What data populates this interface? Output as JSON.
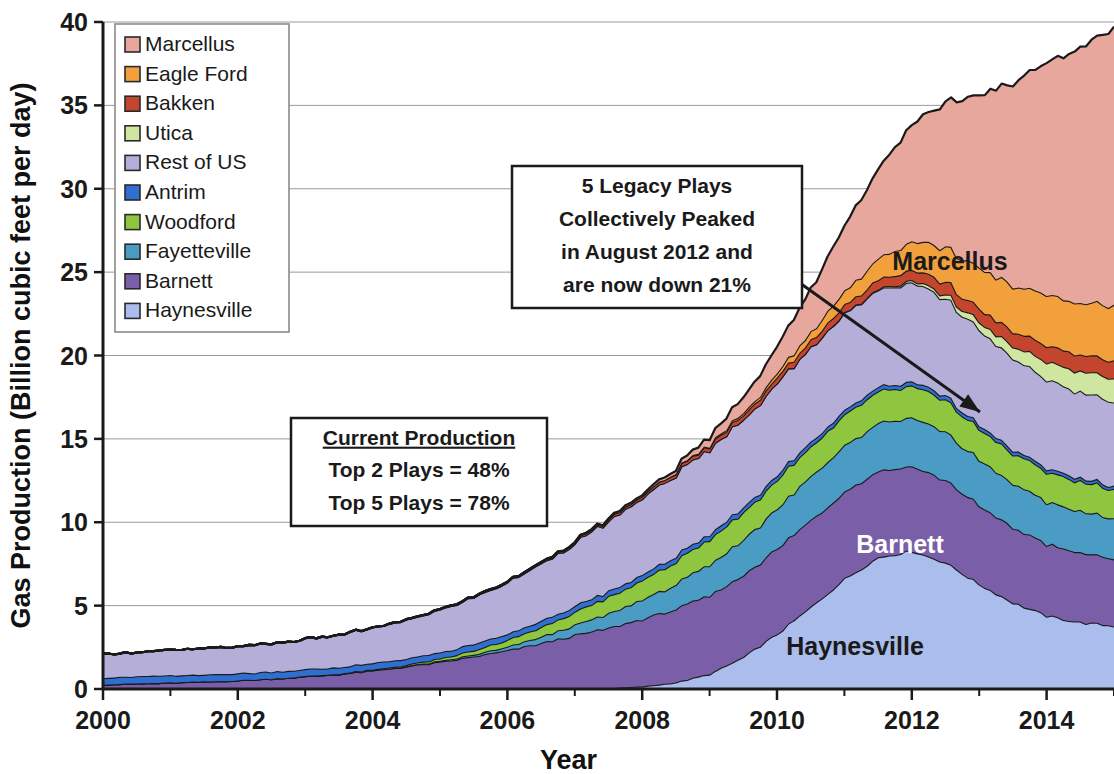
{
  "chart_data": {
    "type": "area",
    "stacked": true,
    "title": "",
    "xlabel": "Year",
    "ylabel": "Gas Production (Billion cubic feet per day)",
    "xlim": [
      2000,
      2015
    ],
    "ylim": [
      0,
      40
    ],
    "yticks": [
      0,
      5,
      10,
      15,
      20,
      25,
      30,
      35,
      40
    ],
    "xticks": [
      2000,
      2002,
      2004,
      2006,
      2008,
      2010,
      2012,
      2014
    ],
    "xtick_labels": [
      "2000",
      "2002",
      "2004",
      "2006",
      "2008",
      "2010",
      "2012",
      "2014"
    ],
    "ytick_labels": [
      "0",
      "5",
      "10",
      "15",
      "20",
      "25",
      "30",
      "35",
      "40"
    ],
    "xminor_step": 1,
    "grid": "horizontal",
    "legend_position": "top-left",
    "legend_order": [
      "Marcellus",
      "Eagle Ford",
      "Bakken",
      "Utica",
      "Rest of US",
      "Antrim",
      "Woodford",
      "Fayetteville",
      "Barnett",
      "Haynesville"
    ],
    "x": [
      2000.0,
      2000.5,
      2001.0,
      2001.5,
      2002.0,
      2002.5,
      2003.0,
      2003.5,
      2004.0,
      2004.5,
      2005.0,
      2005.5,
      2006.0,
      2006.5,
      2007.0,
      2007.5,
      2008.0,
      2008.5,
      2009.0,
      2009.5,
      2010.0,
      2010.5,
      2011.0,
      2011.5,
      2012.0,
      2012.5,
      2013.0,
      2013.5,
      2014.0,
      2014.5,
      2015.0
    ],
    "series": [
      {
        "name": "Haynesville",
        "color": "#aabdec",
        "values": [
          0.0,
          0.0,
          0.0,
          0.0,
          0.0,
          0.0,
          0.0,
          0.0,
          0.0,
          0.0,
          0.0,
          0.0,
          0.0,
          0.0,
          0.02,
          0.05,
          0.15,
          0.4,
          0.9,
          1.9,
          3.3,
          4.9,
          6.6,
          7.9,
          8.3,
          7.6,
          6.3,
          5.2,
          4.4,
          4.0,
          3.8
        ]
      },
      {
        "name": "Barnett",
        "color": "#7a5fa8",
        "values": [
          0.28,
          0.33,
          0.38,
          0.44,
          0.52,
          0.62,
          0.75,
          0.9,
          1.1,
          1.35,
          1.6,
          1.95,
          2.3,
          2.75,
          3.2,
          3.6,
          4.05,
          4.4,
          4.7,
          4.9,
          5.1,
          5.2,
          5.25,
          5.2,
          5.1,
          4.95,
          4.7,
          4.5,
          4.3,
          4.15,
          4.05
        ]
      },
      {
        "name": "Fayetteville",
        "color": "#4a9cc4",
        "values": [
          0.0,
          0.0,
          0.0,
          0.0,
          0.0,
          0.0,
          0.0,
          0.0,
          0.0,
          0.02,
          0.05,
          0.1,
          0.2,
          0.38,
          0.6,
          0.85,
          1.15,
          1.5,
          1.85,
          2.15,
          2.4,
          2.6,
          2.75,
          2.85,
          2.9,
          2.85,
          2.75,
          2.65,
          2.55,
          2.48,
          2.42
        ]
      },
      {
        "name": "Woodford",
        "color": "#8fc640",
        "values": [
          0.0,
          0.0,
          0.0,
          0.0,
          0.0,
          0.0,
          0.01,
          0.02,
          0.04,
          0.08,
          0.14,
          0.25,
          0.4,
          0.58,
          0.78,
          0.98,
          1.18,
          1.35,
          1.5,
          1.62,
          1.72,
          1.8,
          1.86,
          1.9,
          1.92,
          1.9,
          1.86,
          1.82,
          1.78,
          1.76,
          1.74
        ]
      },
      {
        "name": "Antrim",
        "color": "#2f6fd0",
        "values": [
          0.42,
          0.42,
          0.42,
          0.41,
          0.41,
          0.4,
          0.4,
          0.39,
          0.39,
          0.38,
          0.38,
          0.37,
          0.36,
          0.36,
          0.35,
          0.34,
          0.33,
          0.32,
          0.31,
          0.3,
          0.29,
          0.28,
          0.27,
          0.26,
          0.25,
          0.24,
          0.23,
          0.22,
          0.21,
          0.2,
          0.2
        ]
      },
      {
        "name": "Rest of US",
        "color": "#b4aed8",
        "values": [
          1.42,
          1.45,
          1.5,
          1.56,
          1.62,
          1.7,
          1.8,
          1.95,
          2.1,
          2.3,
          2.55,
          2.8,
          3.1,
          3.45,
          3.8,
          4.2,
          4.6,
          4.9,
          5.1,
          5.3,
          5.5,
          5.65,
          5.8,
          5.85,
          5.9,
          5.85,
          5.7,
          5.5,
          5.3,
          5.15,
          5.05
        ]
      },
      {
        "name": "Utica",
        "color": "#cfe6a0",
        "values": [
          0.0,
          0.0,
          0.0,
          0.0,
          0.0,
          0.0,
          0.0,
          0.0,
          0.0,
          0.0,
          0.0,
          0.0,
          0.0,
          0.0,
          0.0,
          0.0,
          0.0,
          0.0,
          0.0,
          0.0,
          0.0,
          0.01,
          0.02,
          0.05,
          0.12,
          0.25,
          0.45,
          0.75,
          1.05,
          1.25,
          1.4
        ]
      },
      {
        "name": "Bakken",
        "color": "#c4452e",
        "values": [
          0.0,
          0.0,
          0.0,
          0.0,
          0.0,
          0.0,
          0.0,
          0.0,
          0.01,
          0.02,
          0.03,
          0.04,
          0.05,
          0.07,
          0.09,
          0.12,
          0.15,
          0.19,
          0.23,
          0.28,
          0.34,
          0.4,
          0.48,
          0.56,
          0.64,
          0.72,
          0.8,
          0.88,
          0.95,
          1.0,
          1.05
        ]
      },
      {
        "name": "Eagle Ford",
        "color": "#f2a03c",
        "values": [
          0.0,
          0.0,
          0.0,
          0.0,
          0.0,
          0.0,
          0.0,
          0.0,
          0.0,
          0.0,
          0.0,
          0.0,
          0.0,
          0.0,
          0.0,
          0.0,
          0.0,
          0.02,
          0.05,
          0.12,
          0.25,
          0.5,
          0.85,
          1.25,
          1.7,
          2.1,
          2.45,
          2.75,
          3.0,
          3.15,
          3.3
        ]
      },
      {
        "name": "Marcellus",
        "color": "#e8a79c",
        "values": [
          0.0,
          0.0,
          0.0,
          0.0,
          0.0,
          0.0,
          0.0,
          0.0,
          0.0,
          0.0,
          0.0,
          0.0,
          0.0,
          0.01,
          0.02,
          0.04,
          0.08,
          0.2,
          0.45,
          0.9,
          1.6,
          2.6,
          3.9,
          5.4,
          7.0,
          8.7,
          10.4,
          12.1,
          13.9,
          15.3,
          16.6
        ]
      }
    ],
    "inline_labels": [
      {
        "text": "Marcellus",
        "color": "#1a1a1a",
        "x": 950,
        "y": 270
      },
      {
        "text": "Barnett",
        "color": "#ffffff",
        "x": 900,
        "y": 553
      },
      {
        "text": "Haynesville",
        "color": "#1a1a1a",
        "x": 855,
        "y": 655
      }
    ],
    "annotations": [
      {
        "id": "legacy-peak-note",
        "lines": [
          "5 Legacy Plays",
          "Collectively Peaked",
          "in August 2012 and",
          "are now down 21%"
        ],
        "underline_first": false,
        "box": {
          "x": 512,
          "y": 166,
          "w": 290,
          "h": 142
        },
        "arrow": {
          "x1": 772,
          "y1": 263,
          "x2": 980,
          "y2": 412
        }
      },
      {
        "id": "current-production-note",
        "lines": [
          "Current Production",
          "Top 2 Plays = 48%",
          "Top 5 Plays = 78%"
        ],
        "underline_first": true,
        "box": {
          "x": 291,
          "y": 418,
          "w": 256,
          "h": 108
        },
        "arrow": null
      }
    ]
  },
  "legend": {
    "items": [
      {
        "label": "Marcellus",
        "color": "#e8a79c"
      },
      {
        "label": "Eagle Ford",
        "color": "#f2a03c"
      },
      {
        "label": "Bakken",
        "color": "#c4452e"
      },
      {
        "label": "Utica",
        "color": "#cfe6a0"
      },
      {
        "label": "Rest of US",
        "color": "#b4aed8"
      },
      {
        "label": "Antrim",
        "color": "#2f6fd0"
      },
      {
        "label": "Woodford",
        "color": "#8fc640"
      },
      {
        "label": "Fayetteville",
        "color": "#4a9cc4"
      },
      {
        "label": "Barnett",
        "color": "#7a5fa8"
      },
      {
        "label": "Haynesville",
        "color": "#aabdec"
      }
    ]
  }
}
